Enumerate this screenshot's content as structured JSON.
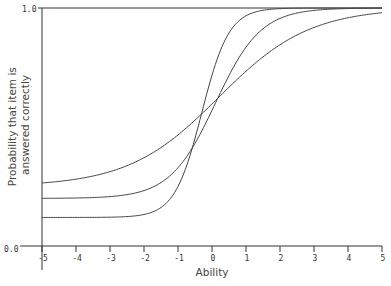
{
  "chart_data": {
    "type": "line",
    "title": "",
    "xlabel": "Ability",
    "ylabel": "Probability that item is answered correctly",
    "ylabel_lines": [
      "Probability that item is",
      "answered correctly"
    ],
    "xlim": [
      -5,
      5
    ],
    "ylim": [
      0,
      1
    ],
    "x_ticks": [
      -5,
      -4,
      -3,
      -2,
      -1,
      0,
      1,
      2,
      3,
      4,
      5
    ],
    "x_tick_labels": [
      "-5",
      "-4",
      "-3",
      "-2",
      "-1",
      "0",
      "1",
      "2",
      "3",
      "4",
      "5"
    ],
    "y_tick_labels": [
      "0.0",
      "1.0"
    ],
    "grid": false,
    "legend": null,
    "series": [
      {
        "name": "Item 1",
        "model": "3PL",
        "c": 0.25,
        "a": 0.75,
        "b": 0.2,
        "x": [
          -5,
          -4,
          -3,
          -2,
          -1,
          0,
          1,
          2,
          3,
          4,
          5
        ],
        "values": [
          0.26,
          0.27,
          0.29,
          0.33,
          0.42,
          0.59,
          0.78,
          0.91,
          0.96,
          0.98,
          0.98
        ]
      },
      {
        "name": "Item 2",
        "model": "3PL",
        "c": 0.2,
        "a": 1.5,
        "b": 0.1,
        "x": [
          -5,
          -4,
          -3,
          -2,
          -1,
          0,
          1,
          2,
          3,
          4,
          5
        ],
        "values": [
          0.2,
          0.2,
          0.21,
          0.23,
          0.35,
          0.57,
          0.85,
          0.96,
          0.99,
          1.0,
          1.0
        ]
      },
      {
        "name": "Item 3",
        "model": "3PL",
        "c": 0.12,
        "a": 2.5,
        "b": -0.3,
        "x": [
          -5,
          -4,
          -3,
          -2,
          -1,
          0,
          1,
          2,
          3,
          4,
          5
        ],
        "values": [
          0.12,
          0.12,
          0.12,
          0.13,
          0.26,
          0.73,
          0.98,
          1.0,
          1.0,
          1.0,
          1.0
        ]
      }
    ]
  },
  "style": {
    "line_color": "#444444",
    "axis_color": "#333333"
  }
}
